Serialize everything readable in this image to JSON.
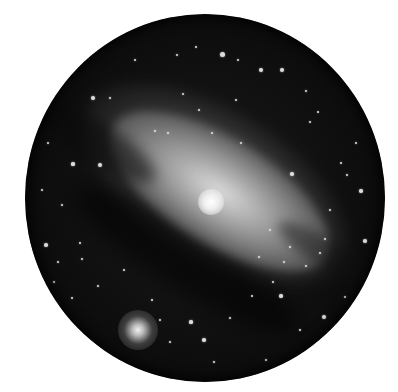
{
  "image": {
    "subject": "galaxy-telescope-sketch",
    "colors": {
      "background": "#ffffff",
      "sky": "#0c0c0c",
      "galaxy_core": "#ffffff",
      "galaxy_disk": "#b4b4b4",
      "star": "#dcdcdc"
    }
  },
  "stars": [
    {
      "x": 222,
      "y": 54,
      "r": 2.5
    },
    {
      "x": 261,
      "y": 70,
      "r": 2
    },
    {
      "x": 282,
      "y": 70,
      "r": 2
    },
    {
      "x": 93,
      "y": 98,
      "r": 2.2
    },
    {
      "x": 100,
      "y": 165,
      "r": 2.2
    },
    {
      "x": 73,
      "y": 164,
      "r": 1.6
    },
    {
      "x": 48,
      "y": 143,
      "r": 1.4
    },
    {
      "x": 292,
      "y": 174,
      "r": 1.8
    },
    {
      "x": 361,
      "y": 191,
      "r": 1.8
    },
    {
      "x": 365,
      "y": 241,
      "r": 1.8
    },
    {
      "x": 324,
      "y": 317,
      "r": 2
    },
    {
      "x": 204,
      "y": 340,
      "r": 1.8
    },
    {
      "x": 191,
      "y": 322,
      "r": 1.6
    },
    {
      "x": 281,
      "y": 296,
      "r": 1.8
    },
    {
      "x": 46,
      "y": 245,
      "r": 1.8
    },
    {
      "x": 80,
      "y": 243,
      "r": 1.4
    },
    {
      "x": 82,
      "y": 259,
      "r": 1.4
    },
    {
      "x": 58,
      "y": 262,
      "r": 1.4
    },
    {
      "x": 177,
      "y": 55,
      "r": 1.2
    },
    {
      "x": 196,
      "y": 47,
      "r": 1.2
    },
    {
      "x": 238,
      "y": 60,
      "r": 1.2
    },
    {
      "x": 306,
      "y": 91,
      "r": 1.2
    },
    {
      "x": 318,
      "y": 112,
      "r": 1.2
    },
    {
      "x": 347,
      "y": 175,
      "r": 1.2
    },
    {
      "x": 310,
      "y": 122,
      "r": 1.2
    },
    {
      "x": 341,
      "y": 163,
      "r": 1.2
    },
    {
      "x": 155,
      "y": 131,
      "r": 1.4
    },
    {
      "x": 168,
      "y": 133,
      "r": 1.2
    },
    {
      "x": 241,
      "y": 143,
      "r": 1.2
    },
    {
      "x": 212,
      "y": 133,
      "r": 1.2
    },
    {
      "x": 110,
      "y": 98,
      "r": 1.2
    },
    {
      "x": 135,
      "y": 60,
      "r": 1.2
    },
    {
      "x": 325,
      "y": 239,
      "r": 1.4
    },
    {
      "x": 306,
      "y": 266,
      "r": 1.4
    },
    {
      "x": 320,
      "y": 253,
      "r": 1.2
    },
    {
      "x": 290,
      "y": 247,
      "r": 1.2
    },
    {
      "x": 252,
      "y": 296,
      "r": 1.2
    },
    {
      "x": 273,
      "y": 282,
      "r": 1.2
    },
    {
      "x": 230,
      "y": 318,
      "r": 1.2
    },
    {
      "x": 170,
      "y": 342,
      "r": 1.2
    },
    {
      "x": 214,
      "y": 362,
      "r": 1.2
    },
    {
      "x": 266,
      "y": 360,
      "r": 1.2
    },
    {
      "x": 300,
      "y": 330,
      "r": 1.2
    },
    {
      "x": 345,
      "y": 297,
      "r": 1.2
    },
    {
      "x": 72,
      "y": 298,
      "r": 1.2
    },
    {
      "x": 54,
      "y": 282,
      "r": 1.2
    },
    {
      "x": 42,
      "y": 190,
      "r": 1.2
    },
    {
      "x": 62,
      "y": 205,
      "r": 1.2
    },
    {
      "x": 152,
      "y": 300,
      "r": 1.4
    },
    {
      "x": 160,
      "y": 320,
      "r": 1.2
    },
    {
      "x": 270,
      "y": 230,
      "r": 1.2
    },
    {
      "x": 284,
      "y": 262,
      "r": 1.2
    },
    {
      "x": 259,
      "y": 257,
      "r": 1.2
    },
    {
      "x": 124,
      "y": 270,
      "r": 1.2
    },
    {
      "x": 98,
      "y": 286,
      "r": 1.2
    },
    {
      "x": 236,
      "y": 100,
      "r": 1.2
    },
    {
      "x": 199,
      "y": 110,
      "r": 1.2
    },
    {
      "x": 183,
      "y": 94,
      "r": 1.2
    },
    {
      "x": 330,
      "y": 210,
      "r": 1.2
    },
    {
      "x": 356,
      "y": 143,
      "r": 1.2
    }
  ],
  "galaxy": {
    "core": {
      "x": 210,
      "y": 200
    },
    "companion": {
      "x": 138,
      "y": 332
    }
  }
}
